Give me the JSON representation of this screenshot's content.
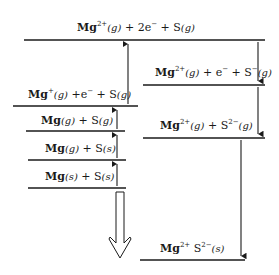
{
  "diagram": {
    "type": "born-haber-cycle",
    "compound": "MgS",
    "levels": [
      {
        "id": "mg2-2e-s",
        "species": "Mg",
        "charge": "2+",
        "state": "(g)",
        "rest": "+ 2e⁻ + S(g)"
      },
      {
        "id": "mg1-e-s",
        "species": "Mg",
        "charge": "+",
        "state": "(g)",
        "rest": "+e⁻ + S(g)"
      },
      {
        "id": "mg-g-s-g",
        "species": "Mg",
        "state": "(g)",
        "rest": "+ S(g)"
      },
      {
        "id": "mg-g-s-s",
        "species": "Mg",
        "state": "(g)",
        "rest": "+ S(s)"
      },
      {
        "id": "mg-s-s-s",
        "species": "Mg",
        "state": "(s)",
        "rest": "+ S(s)"
      },
      {
        "id": "mg2-e-s1",
        "species": "Mg",
        "charge": "2+",
        "state": "(g)",
        "rest": "+ e⁻ + S⁻(g)"
      },
      {
        "id": "mg2-s2",
        "species": "Mg",
        "charge": "2+",
        "state": "(g)",
        "rest": "+ S²⁻(g)"
      },
      {
        "id": "mgs-solid",
        "species": "Mg²⁺ S²⁻",
        "state": "(s)"
      }
    ],
    "labels": {
      "top": {
        "a": "Mg",
        "sup": "2+",
        "st": "(g)",
        "b": " + 2e",
        "sup2": "−",
        "c": " + S",
        "st2": "(g)"
      },
      "l1": {
        "a": "Mg",
        "sup": "+",
        "st": "(g)",
        "b": " +e",
        "sup2": "−",
        "c": " + S",
        "st2": "(g)"
      },
      "l2": {
        "a": "Mg",
        "st": "(g)",
        "b": " + S",
        "st2": "(g)"
      },
      "l3": {
        "a": "Mg",
        "st": "(g)",
        "b": " + S",
        "st2": "(s)"
      },
      "l4": {
        "a": "Mg",
        "st": "(s)",
        "b": " + S",
        "st2": "(s)"
      },
      "r1": {
        "a": "Mg",
        "sup": "2+",
        "st": "(g)",
        "b": " + e",
        "sup2": "−",
        "c": " + S",
        "sup3": "−",
        "st2": "(g)"
      },
      "r2": {
        "a": "Mg",
        "sup": "2+",
        "st": "(g)",
        "b": " + S",
        "sup2": "2−",
        "st2": "(g)"
      },
      "bottom": {
        "a": "Mg",
        "sup": "2+",
        "b": " S",
        "sup2": "2−",
        "st": "(s)"
      }
    },
    "colors": {
      "line": "#1a1a1a",
      "background": "#ffffff"
    }
  }
}
